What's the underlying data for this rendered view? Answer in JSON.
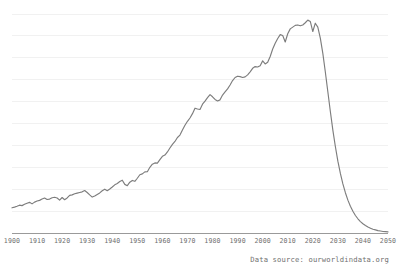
{
  "footer": {
    "source_note": "Data source: ourworldindata.org"
  },
  "colors": {
    "line": "#7d7d7d",
    "gridline": "#f1f1f1",
    "axis": "#9a9a9a",
    "tick_label": "#6f6f6f",
    "background": "#ffffff"
  },
  "chart_data": {
    "type": "line",
    "title": "",
    "subtitle": "",
    "xlabel": "",
    "ylabel": "",
    "xlim": [
      1900,
      2050
    ],
    "ylim": [
      0,
      10
    ],
    "grid": true,
    "grid_axis": "y",
    "gridline_count": 10,
    "legend": false,
    "legend_position": "none",
    "y_tick_labels": [],
    "x_tick_labels": [
      "1900",
      "1910",
      "1920",
      "1930",
      "1940",
      "1950",
      "1960",
      "1970",
      "1980",
      "1990",
      "2000",
      "2010",
      "2020",
      "2030",
      "2040",
      "2050"
    ],
    "x_ticks": [
      1900,
      1910,
      1920,
      1930,
      1940,
      1950,
      1960,
      1970,
      1980,
      1990,
      2000,
      2010,
      2020,
      2030,
      2040,
      2050
    ],
    "annotations": [],
    "series": [
      {
        "name": "series-1",
        "x": [
          1900,
          1901,
          1902,
          1903,
          1904,
          1905,
          1906,
          1907,
          1908,
          1909,
          1910,
          1911,
          1912,
          1913,
          1914,
          1915,
          1916,
          1917,
          1918,
          1919,
          1920,
          1921,
          1922,
          1923,
          1924,
          1925,
          1926,
          1927,
          1928,
          1929,
          1930,
          1931,
          1932,
          1933,
          1934,
          1935,
          1936,
          1937,
          1938,
          1939,
          1940,
          1941,
          1942,
          1943,
          1944,
          1945,
          1946,
          1947,
          1948,
          1949,
          1950,
          1951,
          1952,
          1953,
          1954,
          1955,
          1956,
          1957,
          1958,
          1959,
          1960,
          1961,
          1962,
          1963,
          1964,
          1965,
          1966,
          1967,
          1968,
          1969,
          1970,
          1971,
          1972,
          1973,
          1974,
          1975,
          1976,
          1977,
          1978,
          1979,
          1980,
          1981,
          1982,
          1983,
          1984,
          1985,
          1986,
          1987,
          1988,
          1989,
          1990,
          1991,
          1992,
          1993,
          1994,
          1995,
          1996,
          1997,
          1998,
          1999,
          2000,
          2001,
          2002,
          2003,
          2004,
          2005,
          2006,
          2007,
          2008,
          2009,
          2010,
          2011,
          2012,
          2013,
          2014,
          2015,
          2016,
          2017,
          2018,
          2019,
          2020,
          2021,
          2022,
          2023,
          2024,
          2025,
          2026,
          2027,
          2028,
          2029,
          2030,
          2031,
          2032,
          2033,
          2034,
          2035,
          2036,
          2037,
          2038,
          2039,
          2040,
          2041,
          2042,
          2043,
          2044,
          2045,
          2046,
          2047,
          2048,
          2049,
          2050
        ],
        "values": [
          1.15,
          1.18,
          1.22,
          1.27,
          1.25,
          1.31,
          1.36,
          1.4,
          1.33,
          1.41,
          1.46,
          1.49,
          1.55,
          1.6,
          1.53,
          1.55,
          1.61,
          1.63,
          1.6,
          1.5,
          1.62,
          1.52,
          1.6,
          1.72,
          1.74,
          1.79,
          1.82,
          1.85,
          1.88,
          1.94,
          1.85,
          1.74,
          1.64,
          1.69,
          1.76,
          1.83,
          1.93,
          2.0,
          1.93,
          2.01,
          2.1,
          2.2,
          2.26,
          2.35,
          2.41,
          2.22,
          2.16,
          2.32,
          2.4,
          2.36,
          2.5,
          2.66,
          2.7,
          2.79,
          2.8,
          3.0,
          3.14,
          3.2,
          3.19,
          3.35,
          3.5,
          3.56,
          3.7,
          3.88,
          4.05,
          4.18,
          4.36,
          4.47,
          4.7,
          4.92,
          5.1,
          5.25,
          5.45,
          5.7,
          5.66,
          5.64,
          5.88,
          6.02,
          6.18,
          6.32,
          6.22,
          6.1,
          6.03,
          6.08,
          6.3,
          6.44,
          6.58,
          6.76,
          6.96,
          7.1,
          7.16,
          7.14,
          7.1,
          7.13,
          7.22,
          7.36,
          7.52,
          7.6,
          7.58,
          7.64,
          7.86,
          7.72,
          7.8,
          8.06,
          8.4,
          8.66,
          8.88,
          9.06,
          9.02,
          8.72,
          9.1,
          9.32,
          9.4,
          9.48,
          9.5,
          9.46,
          9.5,
          9.6,
          9.72,
          9.66,
          9.2,
          9.58,
          9.4,
          8.9,
          8.2,
          7.35,
          6.45,
          5.55,
          4.7,
          3.95,
          3.28,
          2.72,
          2.24,
          1.84,
          1.5,
          1.22,
          0.99,
          0.8,
          0.65,
          0.52,
          0.42,
          0.34,
          0.27,
          0.22,
          0.17,
          0.14,
          0.11,
          0.09,
          0.07,
          0.06,
          0.05
        ]
      }
    ]
  }
}
